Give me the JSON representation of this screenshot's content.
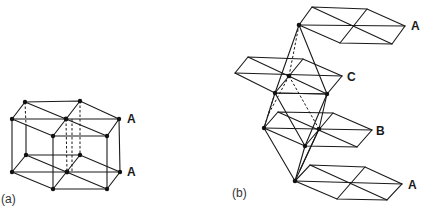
{
  "panels": [
    {
      "id": "a",
      "caption": "(a)",
      "description": "Hexagonal close-packed stacking: two A layers stacked directly above one another (AA stacking), forming a hexagonal prism",
      "layer_labels": [
        "A",
        "A"
      ]
    },
    {
      "id": "b",
      "caption": "(b)",
      "description": "ABCA stacking of close-packed layers showing octahedral/tetrahedral connections between layers",
      "layer_labels": [
        "A",
        "C",
        "B",
        "A"
      ]
    }
  ],
  "labels": {
    "a_top": "A",
    "a_bottom": "A",
    "b_top": "A",
    "b_c": "C",
    "b_b": "B",
    "b_bottom": "A",
    "caption_a": "(a)",
    "caption_b": "(b)"
  },
  "colors": {
    "line": "#1a1a1a",
    "atom": "#111111",
    "background": "#ffffff"
  }
}
